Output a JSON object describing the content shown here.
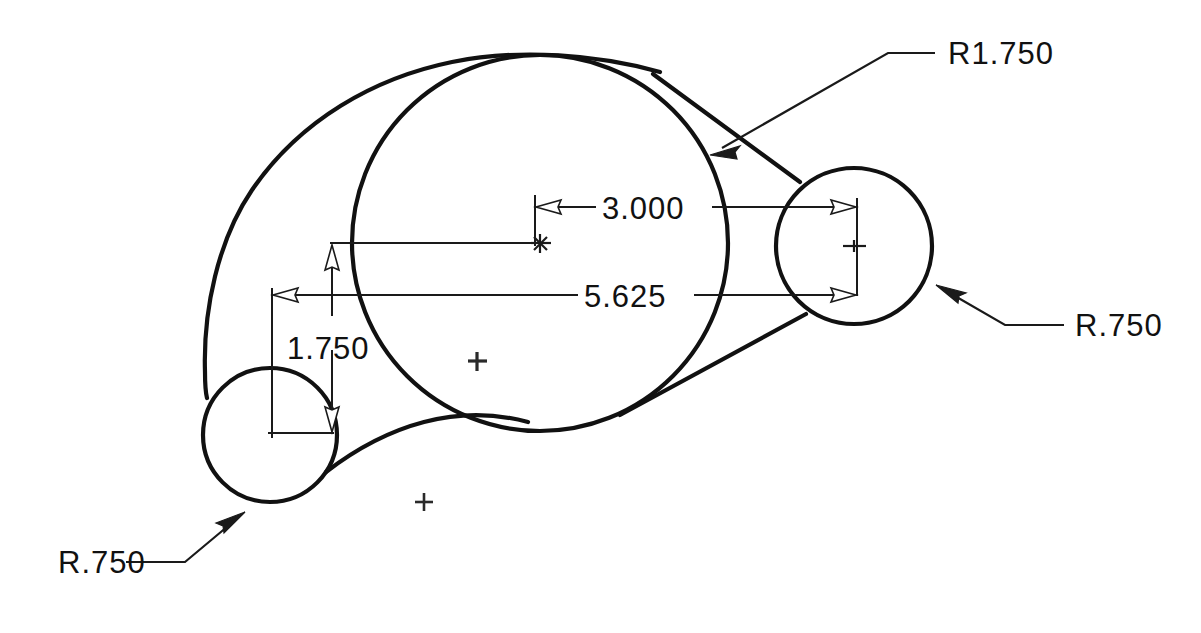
{
  "drawing": {
    "title": "Mechanical part outline drawing",
    "background_color": "#ffffff",
    "line_color": "#111111",
    "width": 1201,
    "height": 633
  },
  "dimensions": {
    "horizontal_center_to_right": "3.000",
    "horizontal_overall": "5.625",
    "vertical_center_to_center": "1.750"
  },
  "callouts": {
    "large_radius": "R1.750",
    "right_radius": "R.750",
    "lower_left_radius": "R.750"
  },
  "geometry": {
    "large_circle": {
      "cx": 540,
      "cy": 243,
      "r": 188
    },
    "right_circle": {
      "cx": 854,
      "cy": 246,
      "r": 78
    },
    "lower_left_circle": {
      "cx": 270,
      "cy": 435,
      "r": 67
    }
  }
}
